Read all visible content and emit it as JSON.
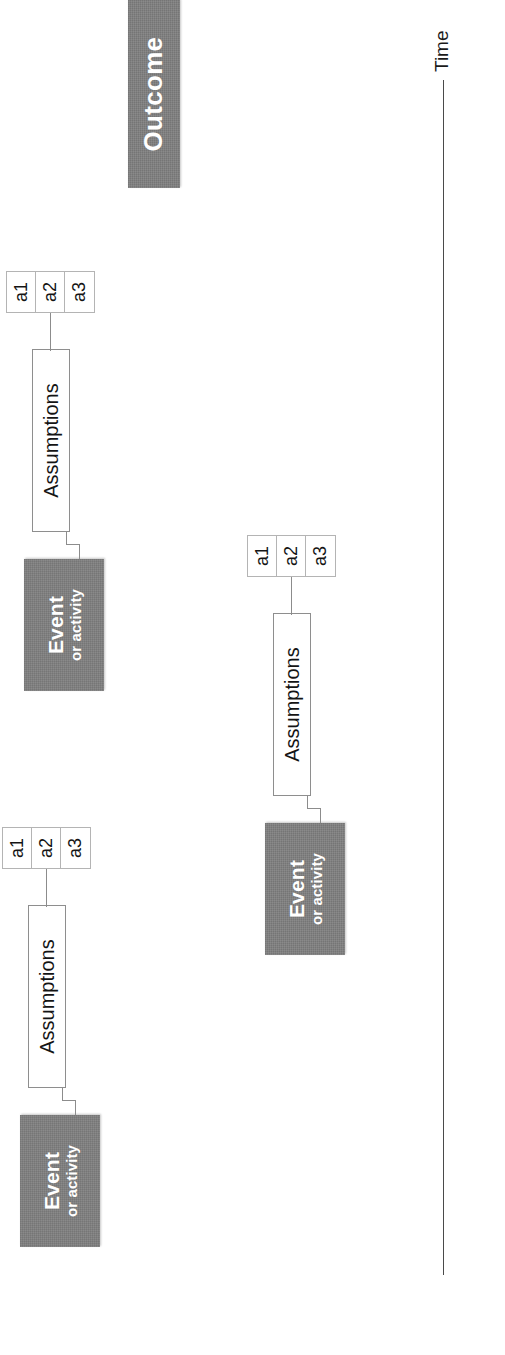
{
  "diagram": {
    "orientation_note": "rotated 90 degrees counter-clockwise",
    "colors": {
      "event_box_fill": "#808080",
      "outcome_box_fill": "#808080",
      "box_text": "#ffffff",
      "assumption_border": "#8e8e8e",
      "assumption_fill": "#ffffff",
      "connector": "#8c8c8c",
      "axis": "#4a4a4a",
      "background": "#ffffff"
    },
    "axis": {
      "label": "Time",
      "icon": "time-arrow-icon"
    },
    "outcome": {
      "label": "Outcome"
    },
    "chains": [
      {
        "id": "chain-1",
        "event": {
          "line1": "Event",
          "line2": "or activity"
        },
        "assumptions": {
          "label": "Assumptions"
        },
        "items": [
          "a1",
          "a2",
          "a3"
        ]
      },
      {
        "id": "chain-2",
        "event": {
          "line1": "Event",
          "line2": "or activity"
        },
        "assumptions": {
          "label": "Assumptions"
        },
        "items": [
          "a1",
          "a2",
          "a3"
        ]
      },
      {
        "id": "chain-3",
        "event": {
          "line1": "Event",
          "line2": "or activity"
        },
        "assumptions": {
          "label": "Assumptions"
        },
        "items": [
          "a1",
          "a2",
          "a3"
        ]
      }
    ]
  }
}
